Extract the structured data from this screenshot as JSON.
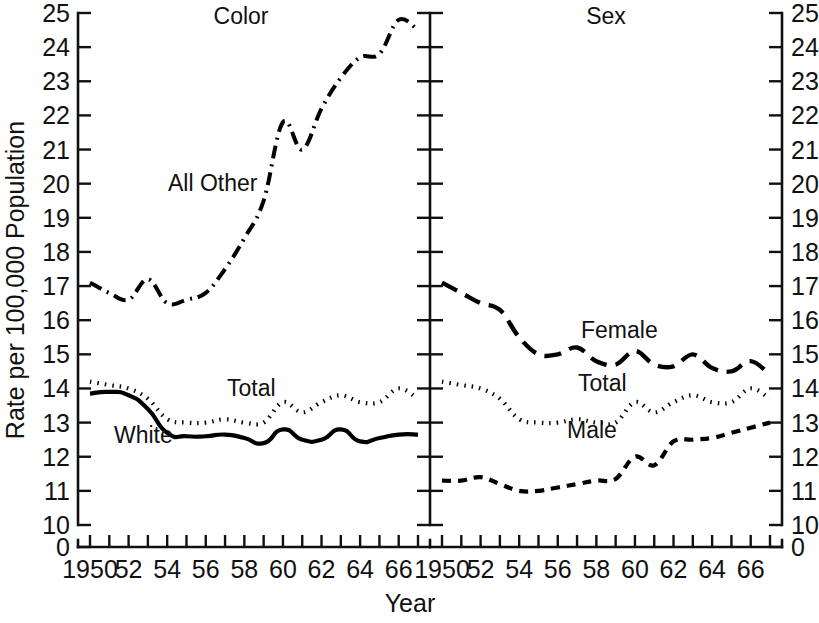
{
  "figure": {
    "xlabel": "Year",
    "ylabel": "Rate per 100,000 Population",
    "panels": [
      {
        "title": "Color"
      },
      {
        "title": "Sex"
      }
    ],
    "y_ticks": [
      "0",
      "10",
      "11",
      "12",
      "13",
      "14",
      "15",
      "16",
      "17",
      "18",
      "19",
      "20",
      "21",
      "22",
      "23",
      "24",
      "25"
    ],
    "x_ticks": [
      "1950",
      "52",
      "54",
      "56",
      "58",
      "60",
      "62",
      "64",
      "66"
    ],
    "series_labels": {
      "all_other": "All Other",
      "white": "White",
      "total_left": "Total",
      "female": "Female",
      "male": "Male",
      "total_right": "Total"
    }
  },
  "chart_data": {
    "type": "line",
    "title": "",
    "subtitle": "",
    "xlabel": "Year",
    "ylabel": "Rate per 100,000 Population",
    "ylim": [
      10,
      25
    ],
    "y_axis_break": "axis broken between 0 and 10",
    "y_ticks": [
      0,
      10,
      11,
      12,
      13,
      14,
      15,
      16,
      17,
      18,
      19,
      20,
      21,
      22,
      23,
      24,
      25
    ],
    "xlim": [
      1950,
      1967
    ],
    "x_ticks": [
      1950,
      1952,
      1954,
      1956,
      1958,
      1960,
      1962,
      1964,
      1966
    ],
    "x_minor_ticks_every": 1,
    "grid": false,
    "legend": "inline labels next to each curve",
    "panels": [
      {
        "title": "Color",
        "x": [
          1950,
          1951,
          1952,
          1953,
          1954,
          1955,
          1956,
          1957,
          1958,
          1959,
          1960,
          1961,
          1962,
          1963,
          1964,
          1965,
          1966,
          1967
        ],
        "series": [
          {
            "name": "All Other",
            "linestyle": "dashdot",
            "label_position": "left of curve, around 1956 at y=20",
            "values": [
              17.1,
              16.8,
              16.6,
              17.2,
              16.5,
              16.6,
              16.8,
              17.5,
              18.4,
              19.5,
              21.8,
              21.0,
              22.2,
              23.1,
              23.7,
              23.8,
              24.8,
              24.5
            ]
          },
          {
            "name": "Total",
            "linestyle": "dotted",
            "label_position": "above curve around 1957 at y=14.3",
            "values": [
              14.2,
              14.1,
              14.0,
              13.7,
              13.1,
              13.0,
              13.0,
              13.1,
              13.0,
              13.0,
              13.6,
              13.3,
              13.6,
              13.8,
              13.6,
              13.6,
              14.0,
              13.7
            ]
          },
          {
            "name": "White",
            "linestyle": "solid",
            "label_position": "below curve around 1953 at y=12.3",
            "values": [
              13.85,
              13.9,
              13.8,
              13.4,
              12.7,
              12.6,
              12.6,
              12.65,
              12.55,
              12.4,
              12.8,
              12.5,
              12.5,
              12.8,
              12.45,
              12.55,
              12.65,
              12.65
            ]
          }
        ]
      },
      {
        "title": "Sex",
        "x": [
          1950,
          1951,
          1952,
          1953,
          1954,
          1955,
          1956,
          1957,
          1958,
          1959,
          1960,
          1961,
          1962,
          1963,
          1964,
          1965,
          1966,
          1967
        ],
        "series": [
          {
            "name": "Female",
            "linestyle": "dashed-long",
            "label_position": "above curve around 1957 at y=15.6",
            "values": [
              17.1,
              16.8,
              16.5,
              16.3,
              15.5,
              15.0,
              15.0,
              15.2,
              14.8,
              14.7,
              15.1,
              14.7,
              14.65,
              15.0,
              14.6,
              14.5,
              14.8,
              14.4
            ]
          },
          {
            "name": "Total",
            "linestyle": "dotted",
            "label_position": "above curve around 1957 at y=14.1",
            "values": [
              14.2,
              14.1,
              14.0,
              13.7,
              13.1,
              13.0,
              13.0,
              13.1,
              13.0,
              13.0,
              13.6,
              13.3,
              13.6,
              13.8,
              13.6,
              13.6,
              14.0,
              13.7
            ]
          },
          {
            "name": "Male",
            "linestyle": "dashed-short",
            "label_position": "above curve around 1957 at y=12.1",
            "values": [
              11.3,
              11.3,
              11.4,
              11.2,
              11.0,
              11.0,
              11.1,
              11.2,
              11.3,
              11.35,
              12.0,
              11.75,
              12.45,
              12.5,
              12.55,
              12.7,
              12.85,
              13.0
            ]
          }
        ]
      }
    ]
  }
}
